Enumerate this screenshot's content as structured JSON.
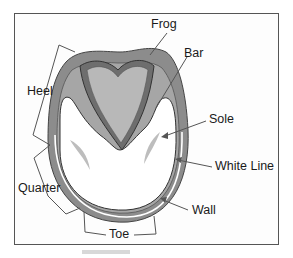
{
  "diagram": {
    "labels": {
      "frog": "Frog",
      "bar": "Bar",
      "heel": "Heel",
      "sole": "Sole",
      "white_line": "White Line",
      "quarter": "Quarter",
      "wall": "Wall",
      "toe": "Toe"
    },
    "colors": {
      "wall": "#8c8c8c",
      "bar": "#a6a6a6",
      "frog_outer": "#6e6e6e",
      "frog_inner": "#b8b8b8",
      "sole": "#ffffff",
      "white_line": "#ffffff",
      "leader_lines": "#555555",
      "frame": "#555555"
    }
  }
}
